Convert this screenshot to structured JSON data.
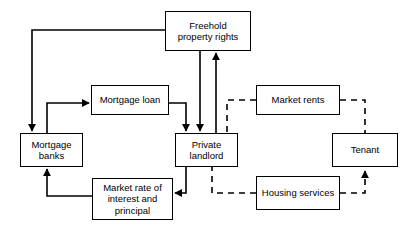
{
  "diagram": {
    "type": "flow-diagram",
    "canvas": {
      "width": 416,
      "height": 232,
      "background": "#ffffff"
    },
    "style": {
      "line_color": "#000000",
      "box_border_color": "#000000",
      "box_fill": "#ffffff",
      "solid_line_label": "solid",
      "dashed_line_label": "dashed"
    },
    "nodes": [
      {
        "id": "freehold",
        "label": "Freehold\nproperty rights",
        "x": 165,
        "y": 11,
        "w": 86,
        "h": 40
      },
      {
        "id": "mortgage_loan",
        "label": "Mortgage loan",
        "x": 91,
        "y": 85,
        "w": 78,
        "h": 30
      },
      {
        "id": "market_rents",
        "label": "Market rents",
        "x": 256,
        "y": 85,
        "w": 84,
        "h": 30
      },
      {
        "id": "mortgage_banks",
        "label": "Mortgage\nbanks",
        "x": 20,
        "y": 133,
        "w": 63,
        "h": 34
      },
      {
        "id": "private_landlord",
        "label": "Private\nlandlord",
        "x": 175,
        "y": 133,
        "w": 63,
        "h": 34
      },
      {
        "id": "tenant",
        "label": "Tenant",
        "x": 332,
        "y": 133,
        "w": 66,
        "h": 34
      },
      {
        "id": "market_rate",
        "label": "Market rate of\ninterest and\nprincipal",
        "x": 92,
        "y": 178,
        "w": 81,
        "h": 42
      },
      {
        "id": "housing_services",
        "label": "Housing services",
        "x": 256,
        "y": 176,
        "w": 84,
        "h": 34
      }
    ],
    "edges": [
      {
        "id": "e1",
        "from": "freehold",
        "to": "mortgage_banks",
        "style": "solid",
        "arrow": "to"
      },
      {
        "id": "e2",
        "from": "mortgage_banks",
        "to": "mortgage_loan",
        "style": "solid",
        "arrow": "to"
      },
      {
        "id": "e3",
        "from": "mortgage_loan",
        "to": "private_landlord",
        "style": "solid",
        "arrow": "to"
      },
      {
        "id": "e4",
        "from": "freehold",
        "to": "private_landlord",
        "style": "solid",
        "arrow": "to"
      },
      {
        "id": "e5",
        "from": "private_landlord",
        "to": "freehold",
        "style": "solid",
        "arrow": "to"
      },
      {
        "id": "e6",
        "from": "private_landlord",
        "to": "market_rate",
        "style": "solid",
        "arrow": "to"
      },
      {
        "id": "e7",
        "from": "market_rate",
        "to": "mortgage_banks",
        "style": "solid",
        "arrow": "to"
      },
      {
        "id": "e8",
        "from": "market_rents",
        "to": "private_landlord",
        "style": "dashed",
        "arrow": "none"
      },
      {
        "id": "e9",
        "from": "market_rents",
        "to": "tenant",
        "style": "dashed",
        "arrow": "none"
      },
      {
        "id": "e10",
        "from": "housing_services",
        "to": "private_landlord",
        "style": "dashed",
        "arrow": "none"
      },
      {
        "id": "e11",
        "from": "housing_services",
        "to": "tenant",
        "style": "dashed",
        "arrow": "to"
      }
    ]
  }
}
